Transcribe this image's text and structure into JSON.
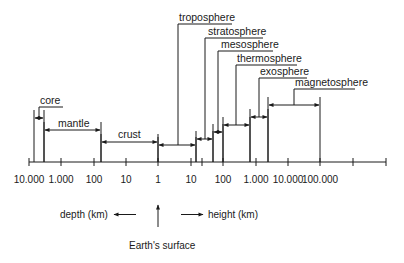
{
  "diagram": {
    "title": "",
    "layers": [
      {
        "name": "core",
        "label": "core",
        "x1": 34,
        "x2": 44,
        "arrow_y": 118,
        "leader_x": 39,
        "label_y": 107,
        "label_x": 40,
        "line_end_x": 63
      },
      {
        "name": "mantle",
        "label": "mantle",
        "x1": 44,
        "x2": 101,
        "arrow_y": 130,
        "label_x": 58,
        "label_y": 127
      },
      {
        "name": "crust",
        "label": "crust",
        "x1": 101,
        "x2": 158,
        "arrow_y": 142,
        "label_x": 118,
        "label_y": 138
      },
      {
        "name": "troposphere",
        "label": "troposphere",
        "x1": 158,
        "x2": 196,
        "arrow_y": 145,
        "leader_x": 178,
        "label_y": 24,
        "label_x": 179,
        "line_end_x": 232
      },
      {
        "name": "stratosphere",
        "label": "stratosphere",
        "x1": 196,
        "x2": 213,
        "arrow_y": 139,
        "leader_x": 205,
        "label_y": 38,
        "label_x": 208,
        "line_end_x": 263
      },
      {
        "name": "mesosphere",
        "label": "mesosphere",
        "x1": 213,
        "x2": 223,
        "arrow_y": 132,
        "leader_x": 218,
        "label_y": 51,
        "label_x": 221,
        "line_end_x": 273
      },
      {
        "name": "thermosphere",
        "label": "thermosphere",
        "x1": 223,
        "x2": 250,
        "arrow_y": 125,
        "leader_x": 236,
        "label_y": 65,
        "label_x": 237,
        "line_end_x": 297
      },
      {
        "name": "exosphere",
        "label": "exosphere",
        "x1": 250,
        "x2": 268,
        "arrow_y": 117,
        "leader_x": 259,
        "label_y": 78,
        "label_x": 260,
        "line_end_x": 307
      },
      {
        "name": "magnetosphere",
        "label": "magnetosphere",
        "x1": 268,
        "x2": 320,
        "arrow_y": 105,
        "leader_x": 294,
        "label_y": 89,
        "label_x": 295,
        "line_end_x": 355
      }
    ],
    "axis": {
      "y": 162,
      "x_start": 29,
      "x_end": 386,
      "ticks": [
        {
          "x": 29,
          "label": "10.000"
        },
        {
          "x": 61,
          "label": "1.000"
        },
        {
          "x": 94,
          "label": "100"
        },
        {
          "x": 126,
          "label": "10"
        },
        {
          "x": 158,
          "label": "1"
        },
        {
          "x": 191,
          "label": "10"
        },
        {
          "x": 202,
          "label": ""
        },
        {
          "x": 223,
          "label": "100"
        },
        {
          "x": 256,
          "label": "1.000"
        },
        {
          "x": 288,
          "label": "10.000"
        },
        {
          "x": 320,
          "label": "100.000"
        },
        {
          "x": 353,
          "label": ""
        },
        {
          "x": 386,
          "label": ""
        }
      ]
    },
    "legend": {
      "depth_label": "depth (km)",
      "height_label": "height (km)",
      "surface_label": "Earth's surface"
    }
  }
}
